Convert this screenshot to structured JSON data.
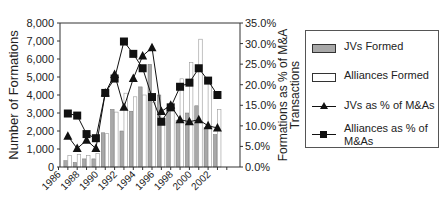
{
  "chart_data": {
    "type": "bar",
    "title": "",
    "xlabel": "",
    "ylabel": "Number of Formations",
    "y2label": "Formations as % of M&A Transactions",
    "ylim": [
      0,
      8000
    ],
    "y2lim": [
      0,
      35
    ],
    "yticks": [
      "0",
      "1,000",
      "2,000",
      "3,000",
      "4,000",
      "5,000",
      "6,000",
      "7,000",
      "8,000"
    ],
    "y2ticks": [
      "0.0%",
      "5.0%",
      "10.0%",
      "15.0%",
      "20.0%",
      "25.0%",
      "30.0%",
      "35.0%"
    ],
    "xtick_labels": [
      "1986",
      "1988",
      "1990",
      "1992",
      "1994",
      "1996",
      "1998",
      "2000",
      "2002"
    ],
    "categories": [
      "1987",
      "1988",
      "1989",
      "1990",
      "1991",
      "1992",
      "1993",
      "1994",
      "1995",
      "1996",
      "1997",
      "1998",
      "1999",
      "2000",
      "2001",
      "2002",
      "2003"
    ],
    "grid": false,
    "legend_position": "right",
    "series": [
      {
        "name": "JVs Formed",
        "type": "bar",
        "axis": "left",
        "color": "#a8a8a8",
        "values": [
          350,
          250,
          450,
          450,
          1900,
          3200,
          2000,
          3100,
          4450,
          5700,
          4000,
          3300,
          2600,
          3000,
          3400,
          2200,
          1800
        ]
      },
      {
        "name": "Alliances Formed",
        "type": "bar",
        "axis": "left",
        "color": "#ffffff",
        "values": [
          650,
          700,
          650,
          750,
          1850,
          3050,
          4100,
          3900,
          4000,
          3600,
          2500,
          3200,
          4900,
          5800,
          7100,
          4800,
          3200
        ]
      },
      {
        "name": "JVs as % of M&As",
        "type": "line",
        "axis": "right",
        "marker": "triangle",
        "color": "#111111",
        "values": [
          7.5,
          4.5,
          6.5,
          4.5,
          18.0,
          22.5,
          14.5,
          21.5,
          27.0,
          29.0,
          13.5,
          15.0,
          11.5,
          11.0,
          11.5,
          10.0,
          9.5
        ]
      },
      {
        "name": "Alliances as % of M&As",
        "type": "line",
        "axis": "right",
        "marker": "square",
        "color": "#111111",
        "values": [
          13.0,
          12.5,
          8.0,
          7.0,
          18.0,
          21.5,
          30.5,
          27.5,
          24.0,
          17.0,
          11.0,
          14.5,
          19.5,
          20.5,
          24.0,
          21.0,
          17.5
        ]
      }
    ]
  },
  "legend": {
    "items": [
      {
        "label": "JVs Formed"
      },
      {
        "label": "Alliances Formed"
      },
      {
        "label": "JVs as % of M&As"
      },
      {
        "label_line1": "Alliances as % of",
        "label_line2": "M&As"
      }
    ]
  }
}
